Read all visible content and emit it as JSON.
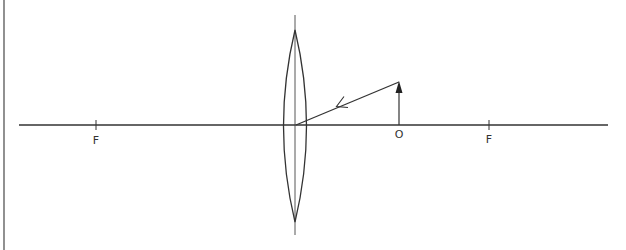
{
  "diagram": {
    "type": "optics-ray-diagram",
    "colors": {
      "stroke": "#333333",
      "background": "#ffffff"
    },
    "labels": {
      "focal_left": "F",
      "object": "O",
      "focal_right": "F"
    },
    "elements": {
      "principal_axis": {
        "x1": 19,
        "y": 125,
        "x2": 608
      },
      "lens": {
        "center_x": 295,
        "top_y": 30,
        "bottom_y": 222,
        "half_width": 11
      },
      "lens_axis": {
        "x": 295,
        "y1": 15,
        "y2": 235
      },
      "focal_left_x": 96,
      "focal_right_x": 489,
      "object": {
        "x": 399,
        "base_y": 125,
        "tip_y": 82
      },
      "ray": {
        "from": [
          399,
          82
        ],
        "to": [
          295,
          125
        ],
        "direction": "toward lens"
      }
    }
  }
}
